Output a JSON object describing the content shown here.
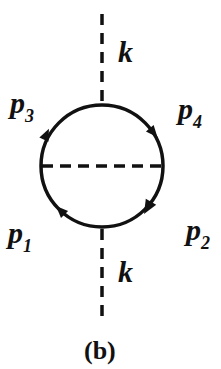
{
  "diagram": {
    "type": "feynman-diagram",
    "caption": "(b)",
    "labels": {
      "k_top": "k",
      "k_bottom": "k",
      "p3": {
        "main": "p",
        "sub": "3"
      },
      "p4": {
        "main": "p",
        "sub": "4"
      },
      "p1": {
        "main": "p",
        "sub": "1"
      },
      "p2": {
        "main": "p",
        "sub": "2"
      }
    },
    "colors": {
      "line": "#111111",
      "background": "#ffffff"
    }
  }
}
